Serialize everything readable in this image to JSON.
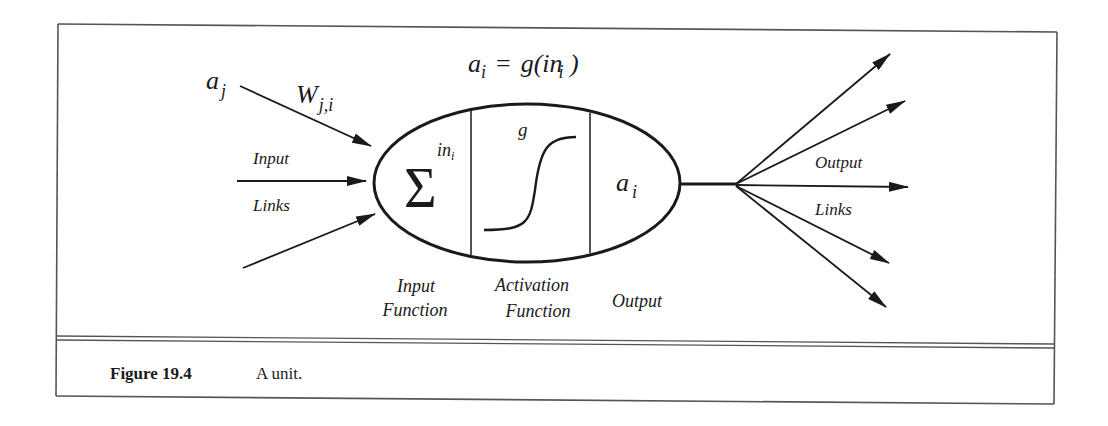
{
  "figure": {
    "equation": {
      "lhs_var": "a",
      "lhs_sub": "i",
      "equals": "=",
      "rhs_func": "g(in",
      "rhs_sub": "i",
      "rhs_close": " )"
    },
    "input_activation": {
      "var": "a",
      "sub": "j"
    },
    "weight": {
      "var": "W",
      "sub": "j,i"
    },
    "input_links_label": {
      "line1": "Input",
      "line2": "Links"
    },
    "sum_symbol": "Σ",
    "sum_output": {
      "var": "in",
      "sub": "i"
    },
    "activation_symbol": "g",
    "unit_output": {
      "var": "a",
      "sub": "i"
    },
    "component_labels": {
      "input_function": {
        "line1": "Input",
        "line2": "Function"
      },
      "activation_function": {
        "line1": "Activation",
        "line2": "Function"
      },
      "output": "Output"
    },
    "output_links_label": {
      "line1": "Output",
      "line2": "Links"
    }
  },
  "caption": {
    "number": "Figure 19.4",
    "text": "A unit."
  },
  "colors": {
    "ink": "#1a1a1a",
    "frame": "#555555",
    "background": "#ffffff"
  }
}
